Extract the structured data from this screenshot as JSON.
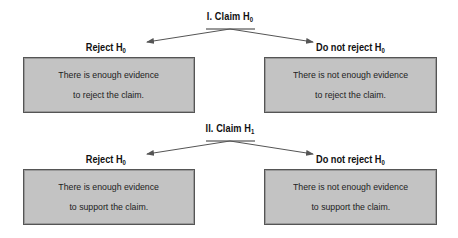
{
  "sections": [
    {
      "title": "I. Claim H",
      "title_sub": "0",
      "left": {
        "label": "Reject H",
        "label_sub": "0",
        "lines": [
          "There is enough evidence",
          "to reject the claim."
        ]
      },
      "right": {
        "label": "Do not reject H",
        "label_sub": "0",
        "lines": [
          "There is not enough evidence",
          "to reject the claim."
        ]
      }
    },
    {
      "title": "II. Claim H",
      "title_sub": "1",
      "left": {
        "label": "Reject H",
        "label_sub": "0",
        "lines": [
          "There is enough evidence",
          "to support the claim."
        ]
      },
      "right": {
        "label": "Do not reject H",
        "label_sub": "0",
        "lines": [
          "There is not enough evidence",
          "to support the claim."
        ]
      }
    }
  ],
  "colors": {
    "box_fill": "#c3c3c3",
    "box_border": "#555555",
    "arrow": "#555555"
  }
}
